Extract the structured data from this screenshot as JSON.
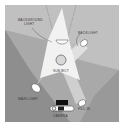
{
  "diagram": {
    "labels": {
      "background_light_line1": "BACKGROUND",
      "background_light_line2": "LIGHT",
      "backlight": "BACKLIGHT",
      "subject": "SUBJECT",
      "main_light": "MAIN LIGHT",
      "fill_in": "FILL-IN",
      "camera": "CAMERA"
    },
    "colors": {
      "border": "#ffffff",
      "floor_dark": "#8e8e8e",
      "floor_mid": "#a9a9a9",
      "floor_light": "#c4c4c4",
      "beam": "#f2f2f2",
      "beam_secondary": "#bdbdbd",
      "lamp": "#ffffff",
      "camera_body": "#111111",
      "subject_fill": "#d8d8d8"
    }
  }
}
